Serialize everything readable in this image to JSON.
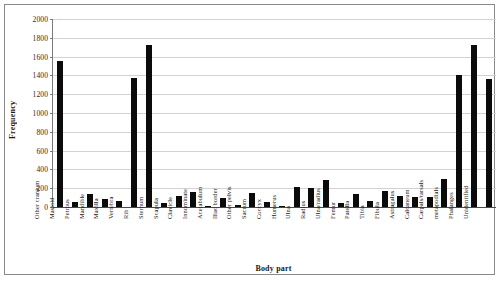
{
  "chart_data": {
    "type": "bar",
    "title": "",
    "xlabel": "Body part",
    "ylabel": "Frequency",
    "ylim": [
      0,
      2000
    ],
    "ytick_step": 200,
    "yticks": [
      0,
      200,
      400,
      600,
      800,
      1000,
      1200,
      1400,
      1600,
      1800,
      2000
    ],
    "grid": true,
    "legend": "none",
    "bar_color": "#0b0b0b",
    "categories": [
      "Other cranium",
      "Mastoid",
      "Petrous",
      "Mandible",
      "Maxilla",
      "Vertebra",
      "Rib",
      "Sternum",
      "Scapula",
      "Clavicle",
      "Innominate",
      "Acetabulum",
      "Iliac border",
      "Other pelvis",
      "Sacrum",
      "Coccyx",
      "Humerus",
      "Ulna",
      "Radius",
      "Ulna/radius",
      "Femur",
      "Patella",
      "Tibia",
      "Fibula",
      "Astragalus",
      "Calcaneum",
      "Carpals/tarsals",
      "metapodials",
      "Phalanges",
      "Unidentified"
    ],
    "values": [
      1550,
      50,
      140,
      80,
      60,
      1370,
      1720,
      40,
      120,
      160,
      10,
      95,
      20,
      150,
      55,
      5,
      210,
      200,
      290,
      40,
      140,
      60,
      170,
      120,
      110,
      105,
      300,
      1400,
      1720,
      1360
    ]
  }
}
